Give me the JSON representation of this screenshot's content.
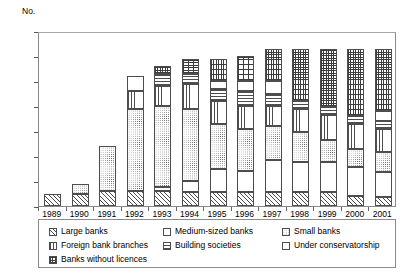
{
  "chart_data": {
    "type": "bar",
    "stacked": true,
    "title": "",
    "subtitle": "",
    "xlabel": "",
    "ylabel": "No.",
    "ylim": [
      0,
      70
    ],
    "ytick_step": 10,
    "yticks": [
      "70",
      "60",
      "50",
      "40",
      "30",
      "20",
      "10",
      "0"
    ],
    "grid": false,
    "legend_position": "bottom",
    "categories": [
      "1989",
      "1990",
      "1991",
      "1992",
      "1993",
      "1994",
      "1995",
      "1996",
      "1997",
      "1998",
      "1999",
      "2000",
      "2001"
    ],
    "series": [
      {
        "name": "Large banks",
        "pattern": "diagonal",
        "values": [
          5,
          5,
          6,
          6,
          6,
          5.5,
          5.5,
          5.5,
          5.5,
          5.5,
          5.5,
          4,
          3.5
        ]
      },
      {
        "name": "Medium-sized banks",
        "pattern": "light-hatch",
        "values": [
          0,
          0,
          0,
          0,
          1.5,
          4.5,
          9.5,
          8.5,
          13,
          12,
          12,
          11.5,
          10
        ]
      },
      {
        "name": "Small banks",
        "pattern": "dots",
        "values": [
          0,
          4,
          18,
          33,
          32.5,
          29,
          18,
          17,
          13.5,
          12,
          9,
          7.5,
          8
        ]
      },
      {
        "name": "Foreign bank branches",
        "pattern": "vertical",
        "values": [
          0,
          0,
          0,
          7,
          8,
          10,
          9,
          9,
          8,
          9.5,
          10,
          10,
          9.5
        ]
      },
      {
        "name": "Building societies",
        "pattern": "horizontal",
        "values": [
          0,
          0,
          0,
          0,
          5,
          4,
          5,
          6,
          5,
          3,
          3,
          3,
          3
        ]
      },
      {
        "name": "Under conservatorship",
        "pattern": "plain",
        "values": [
          0,
          0,
          0,
          6,
          0,
          0,
          3,
          4,
          5,
          0,
          0,
          0,
          4
        ]
      },
      {
        "name": "Banks without licences",
        "pattern": "grid",
        "values": [
          0,
          0,
          0,
          0,
          3,
          6,
          9,
          10,
          13,
          21,
          23.5,
          27,
          25
        ]
      }
    ],
    "totals": [
      5,
      9,
      24,
      52,
      56,
      59,
      59,
      60,
      63,
      63,
      63,
      63,
      63
    ]
  },
  "legend": {
    "items": [
      {
        "label": "Large banks",
        "icon": "swatch-diagonal-hatch-icon"
      },
      {
        "label": "Medium-sized banks",
        "icon": "swatch-light-hatch-icon"
      },
      {
        "label": "Small banks",
        "icon": "swatch-dots-icon"
      },
      {
        "label": "Foreign bank branches",
        "icon": "swatch-vertical-lines-icon"
      },
      {
        "label": "Building societies",
        "icon": "swatch-horizontal-lines-icon"
      },
      {
        "label": "Under conservatorship",
        "icon": "swatch-plain-icon"
      },
      {
        "label": "Banks without licences",
        "icon": "swatch-grid-icon"
      }
    ]
  }
}
